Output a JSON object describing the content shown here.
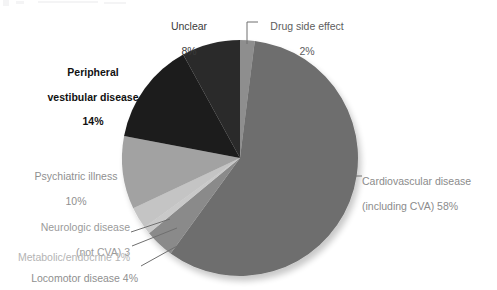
{
  "chart_data": {
    "type": "pie",
    "title": "",
    "subtitle": "",
    "xlabel": "",
    "ylabel": "",
    "legend_position": "labels-with-leader-lines",
    "grid": false,
    "units": "percent",
    "total": 100,
    "start_angle_deg": 0,
    "direction": "clockwise",
    "categories": [
      "Drug side effect",
      "Cardiovascular disease (including CVA)",
      "Locomotor disease",
      "Metabolic/endocrine",
      "Neurologic disease (not CVA)",
      "Psychiatric illness",
      "Peripheral vestibular disease",
      "Unclear"
    ],
    "values": [
      2,
      58,
      4,
      1,
      3,
      10,
      14,
      8
    ],
    "colors": [
      "#8e8e8e",
      "#6e6e6e",
      "#8a8a8a",
      "#c9c9c9",
      "#c4c4c4",
      "#a2a2a2",
      "#1d1d1d",
      "#2c2c2c"
    ],
    "slices": [
      {
        "name": "Drug side effect",
        "value": 2,
        "display": "2%",
        "color": "#8e8e8e",
        "start_deg": 0,
        "end_deg": 7.2
      },
      {
        "name": "Cardiovascular disease (including CVA)",
        "value": 58,
        "display": "58%",
        "color": "#6e6e6e",
        "start_deg": 7.2,
        "end_deg": 216.0
      },
      {
        "name": "Locomotor disease",
        "value": 4,
        "display": "4%",
        "color": "#8a8a8a",
        "start_deg": 216.0,
        "end_deg": 230.4
      },
      {
        "name": "Metabolic/endocrine",
        "value": 1,
        "display": "1%",
        "color": "#c9c9c9",
        "start_deg": 230.4,
        "end_deg": 234.0
      },
      {
        "name": "Neurologic disease (not CVA)",
        "value": 3,
        "display": "3",
        "color": "#c4c4c4",
        "start_deg": 234.0,
        "end_deg": 244.8
      },
      {
        "name": "Psychiatric illness",
        "value": 10,
        "display": "10%",
        "color": "#a2a2a2",
        "start_deg": 244.8,
        "end_deg": 280.8
      },
      {
        "name": "Peripheral vestibular disease",
        "value": 14,
        "display": "14%",
        "color": "#1d1d1d",
        "start_deg": 280.8,
        "end_deg": 331.2
      },
      {
        "name": "Unclear",
        "value": 8,
        "display": "8%",
        "color": "#2c2c2c",
        "start_deg": 331.2,
        "end_deg": 360.0
      }
    ]
  },
  "labels": {
    "unclear": {
      "line1": "Unclear",
      "line2": "8%"
    },
    "drug": {
      "line1": "Drug side effect",
      "line2": "2%"
    },
    "peripheral": {
      "line1": "Peripheral",
      "line2": "vestibular disease",
      "line3": "14%"
    },
    "psychiatric": {
      "line1": "Psychiatric illness",
      "line2": "10%"
    },
    "neurologic": {
      "line1": "Neurologic disease",
      "line2": "(not CVA) 3"
    },
    "metabolic": {
      "line1": "Metabolic/endocrine 1%"
    },
    "locomotor": {
      "line1": "Locomotor disease 4%"
    },
    "cardio": {
      "line1": "Cardiovascular disease",
      "line2": "(including CVA) 58%"
    }
  },
  "style": {
    "background": "#ffffff",
    "leader_line_color": "#6f6f6f",
    "pie_center_x": 240,
    "pie_center_y": 158,
    "pie_radius": 118
  }
}
